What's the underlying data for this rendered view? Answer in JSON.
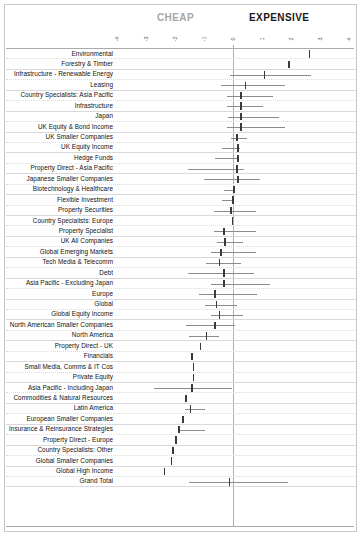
{
  "header": {
    "cheap_label": "CHEAP",
    "expensive_label": "EXPENSIVE",
    "cheap_color": "#a6a6a6",
    "expensive_color": "#1a1a1a"
  },
  "chart_data": {
    "type": "bar",
    "title": "",
    "subtitle": "",
    "xlabel": "",
    "ylabel": "",
    "xlim": [
      -4,
      4
    ],
    "grid": true,
    "legend_position": "none",
    "annotations": [
      "CHEAP",
      "EXPENSIVE"
    ],
    "tick_labels": [
      "-4",
      "-3",
      "-2",
      "-1",
      "0",
      "1",
      "2",
      "3",
      "4"
    ],
    "tick_values": [
      -4,
      -3,
      -2,
      -1,
      0,
      1,
      2,
      3,
      4
    ],
    "zero_reference": 0,
    "marker_series": "median",
    "range_series": "min-max range",
    "categories": [
      "Environmental",
      "Forestry & Timber",
      "Infrastructure - Renewable Energy",
      "Leasing",
      "Country Specialists: Asia Pacific",
      "Infrastructure",
      "Japan",
      "UK Equity & Bond Income",
      "UK Smaller Companies",
      "UK Equity Income",
      "Hedge Funds",
      "Property Direct - Asia Pacific",
      "Japanese Smaller Companies",
      "Biotechnology & Healthcare",
      "Flexible Investment",
      "Property Securities",
      "Country Specialists: Europe",
      "Property Specialist",
      "UK All Companies",
      "Global Emerging Markets",
      "Tech Media & Telecomm",
      "Debt",
      "Asia Pacific - Excluding Japan",
      "Europe",
      "Global",
      "Global Equity Income",
      "North American Smaller Companies",
      "North America",
      "Property Direct - UK",
      "Financials",
      "Small Media, Comms & IT Cos",
      "Private Equity",
      "Asia Pacific - Including Japan",
      "Commodities & Natural Resources",
      "Latin America",
      "European Smaller Companies",
      "Insurance & Reinsurance Strategies",
      "Property Direct - Europe",
      "Country Specialists: Other",
      "Global Smaller Companies",
      "Global High Income",
      "Grand Total"
    ],
    "values": [
      2.65,
      1.95,
      1.1,
      0.45,
      0.3,
      0.3,
      0.3,
      0.3,
      0.15,
      0.2,
      0.18,
      0.15,
      0.2,
      0.05,
      0.02,
      -0.05,
      0.0,
      -0.3,
      -0.25,
      -0.4,
      -0.45,
      -0.3,
      -0.3,
      -0.6,
      -0.55,
      -0.45,
      -0.6,
      -0.9,
      -1.1,
      -1.4,
      -1.35,
      -1.35,
      -1.4,
      -1.6,
      -1.45,
      -1.7,
      -1.85,
      -1.95,
      -2.05,
      -2.1,
      -2.35,
      -0.1
    ],
    "low": [
      2.65,
      1.95,
      -0.1,
      -0.4,
      -0.2,
      -0.2,
      -0.15,
      -0.2,
      -0.05,
      -0.35,
      -0.6,
      -1.55,
      -1.0,
      -0.3,
      -0.35,
      -0.65,
      0.0,
      -0.65,
      -0.55,
      -0.75,
      -0.9,
      -1.55,
      -0.75,
      -1.15,
      -0.95,
      -0.75,
      -1.6,
      -1.5,
      -1.1,
      -1.4,
      -1.35,
      -1.35,
      -2.7,
      -1.6,
      -1.65,
      -1.7,
      -1.85,
      -1.95,
      -2.05,
      -2.1,
      -2.35,
      -1.5
    ],
    "high": [
      2.65,
      1.95,
      2.7,
      1.8,
      1.4,
      1.05,
      1.6,
      1.8,
      0.5,
      0.25,
      0.18,
      0.4,
      0.95,
      0.05,
      0.02,
      0.8,
      0.0,
      0.8,
      0.35,
      0.8,
      0.3,
      0.75,
      1.3,
      0.85,
      0.15,
      0.35,
      0.1,
      -0.45,
      -1.1,
      -1.4,
      -1.35,
      -1.35,
      0.0,
      -1.6,
      -0.95,
      -1.7,
      -0.95,
      -1.95,
      -2.05,
      -2.1,
      -2.35,
      1.9
    ]
  }
}
